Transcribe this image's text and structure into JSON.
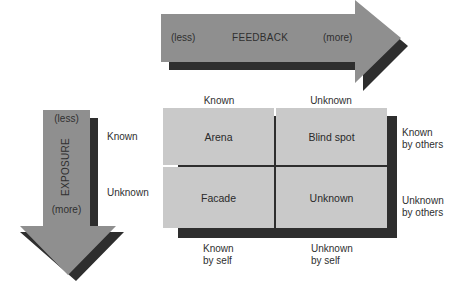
{
  "diagram": {
    "colors": {
      "arrow_fill": "#8f8f8f",
      "arrow_shadow": "#2e2e2e",
      "cell_fill": "#c9c9c9",
      "divider": "#f2f2f2"
    },
    "feedback_arrow": {
      "left_label": "(less)",
      "center_label": "FEEDBACK",
      "right_label": "(more)"
    },
    "exposure_arrow": {
      "top_label": "(less)",
      "center_label": "EXPOSURE",
      "bottom_label": "(more)"
    },
    "self_row_labels": {
      "known": "Known",
      "unknown": "Unknown"
    },
    "column_headers": {
      "known": "Known",
      "unknown": "Unknown"
    },
    "others_labels": {
      "known_line1": "Known",
      "known_line2": "by others",
      "unknown_line1": "Unknown",
      "unknown_line2": "by others"
    },
    "self_labels": {
      "known_line1": "Known",
      "known_line2": "by self",
      "unknown_line1": "Unknown",
      "unknown_line2": "by self"
    },
    "cells": {
      "top_left": "Arena",
      "top_right": "Blind spot",
      "bottom_left": "Facade",
      "bottom_right": "Unknown"
    }
  }
}
